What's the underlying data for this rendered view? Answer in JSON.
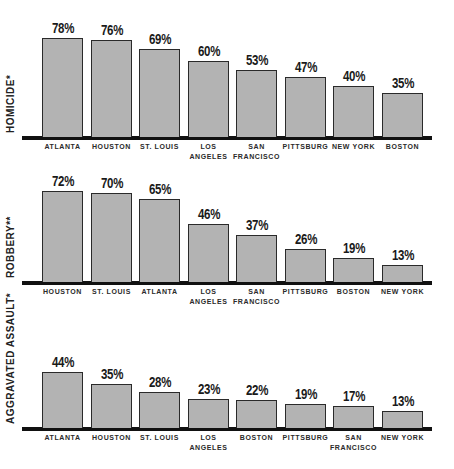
{
  "chart_data": [
    {
      "type": "bar",
      "title": "",
      "ylabel": "HOMICIDE*",
      "xlabel": "",
      "categories": [
        "ATLANTA",
        "HOUSTON",
        "ST. LOUIS",
        "LOS\nANGELES",
        "SAN\nFRANCISCO",
        "PITTSBURG",
        "NEW YORK",
        "BOSTON"
      ],
      "values": [
        78,
        76,
        69,
        60,
        53,
        47,
        40,
        35
      ],
      "value_labels": [
        "78%",
        "76%",
        "69%",
        "60%",
        "53%",
        "47%",
        "40%",
        "35%"
      ],
      "ylim": [
        0,
        100
      ],
      "grid": false,
      "legend": "none"
    },
    {
      "type": "bar",
      "title": "",
      "ylabel": "ROBBERY**",
      "xlabel": "",
      "categories": [
        "HOUSTON",
        "ST. LOUIS",
        "ATLANTA",
        "LOS\nANGELES",
        "SAN\nFRANCISCO",
        "PITTSBURG",
        "BOSTON",
        "NEW YORK"
      ],
      "values": [
        72,
        70,
        65,
        46,
        37,
        26,
        19,
        13
      ],
      "value_labels": [
        "72%",
        "70%",
        "65%",
        "46%",
        "37%",
        "26%",
        "19%",
        "13%"
      ],
      "ylim": [
        0,
        100
      ],
      "grid": false,
      "legend": "none"
    },
    {
      "type": "bar",
      "title": "",
      "ylabel": "AGGRAVATED ASSAULT*",
      "xlabel": "",
      "categories": [
        "ATLANTA",
        "HOUSTON",
        "ST. LOUIS",
        "LOS\nANGELES",
        "BOSTON",
        "PITTSBURG",
        "SAN\nFRANCISCO",
        "NEW YORK"
      ],
      "values": [
        44,
        35,
        28,
        23,
        22,
        19,
        17,
        13
      ],
      "value_labels": [
        "44%",
        "35%",
        "28%",
        "23%",
        "22%",
        "19%",
        "17%",
        "13%"
      ],
      "ylim": [
        0,
        100
      ],
      "grid": false,
      "legend": "none"
    }
  ],
  "colors": {
    "bar_fill": "#b3b3b3",
    "bar_border": "#2a2a2a",
    "baseline": "#111111",
    "text": "#1a1a1a"
  }
}
